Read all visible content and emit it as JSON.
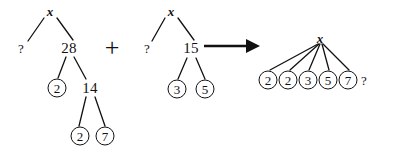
{
  "figure": {
    "operator": "+",
    "arrow": "right-arrow"
  },
  "tree_left": {
    "root": {
      "label": "x",
      "x": 50,
      "y": 11
    },
    "nodes": [
      {
        "id": "l-q",
        "label": "?",
        "style": "plain",
        "x": 21,
        "y": 48
      },
      {
        "id": "l-28",
        "label": "28",
        "style": "plain",
        "x": 69,
        "y": 48
      },
      {
        "id": "l-2a",
        "label": "2",
        "style": "circled",
        "x": 57,
        "y": 88
      },
      {
        "id": "l-14",
        "label": "14",
        "style": "plain",
        "x": 90,
        "y": 88
      },
      {
        "id": "l-2b",
        "label": "2",
        "style": "circled",
        "x": 80,
        "y": 136
      },
      {
        "id": "l-7",
        "label": "7",
        "style": "circled",
        "x": 105,
        "y": 136
      }
    ],
    "edges": [
      {
        "from": "root",
        "to": "l-q"
      },
      {
        "from": "root",
        "to": "l-28"
      },
      {
        "from": "l-28",
        "to": "l-2a"
      },
      {
        "from": "l-28",
        "to": "l-14"
      },
      {
        "from": "l-14",
        "to": "l-2b"
      },
      {
        "from": "l-14",
        "to": "l-7"
      }
    ]
  },
  "tree_right": {
    "root": {
      "label": "x",
      "x": 171,
      "y": 11
    },
    "nodes": [
      {
        "id": "r-q",
        "label": "?",
        "style": "plain",
        "x": 147,
        "y": 48
      },
      {
        "id": "r-15",
        "label": "15",
        "style": "plain",
        "x": 191,
        "y": 48
      },
      {
        "id": "r-3",
        "label": "3",
        "style": "circled",
        "x": 177,
        "y": 89
      },
      {
        "id": "r-5",
        "label": "5",
        "style": "circled",
        "x": 205,
        "y": 89
      }
    ],
    "edges": [
      {
        "from": "root",
        "to": "r-q"
      },
      {
        "from": "root",
        "to": "r-15"
      },
      {
        "from": "r-15",
        "to": "r-3"
      },
      {
        "from": "r-15",
        "to": "r-5"
      }
    ]
  },
  "tree_result": {
    "root": {
      "label": "x",
      "x": 320,
      "y": 38
    },
    "nodes": [
      {
        "id": "res-1",
        "label": "2",
        "style": "circled",
        "x": 268,
        "y": 80
      },
      {
        "id": "res-2",
        "label": "2",
        "style": "circled",
        "x": 288,
        "y": 80
      },
      {
        "id": "res-3",
        "label": "3",
        "style": "circled",
        "x": 308,
        "y": 80
      },
      {
        "id": "res-4",
        "label": "5",
        "style": "circled",
        "x": 328,
        "y": 80
      },
      {
        "id": "res-5",
        "label": "7",
        "style": "circled",
        "x": 348,
        "y": 80
      },
      {
        "id": "res-q",
        "label": "?",
        "style": "plain-small",
        "x": 364,
        "y": 80
      }
    ],
    "edges": [
      {
        "from": "root",
        "to": "res-1"
      },
      {
        "from": "root",
        "to": "res-2"
      },
      {
        "from": "root",
        "to": "res-3"
      },
      {
        "from": "root",
        "to": "res-4"
      },
      {
        "from": "root",
        "to": "res-5"
      }
    ]
  },
  "symbols": {
    "plus": {
      "label": "+",
      "x": 112,
      "y": 48
    },
    "arrow": {
      "x1": 206,
      "y1": 48,
      "x2": 258,
      "y2": 48
    }
  },
  "colors": {
    "ink": "#111111",
    "background": "#ffffff"
  }
}
